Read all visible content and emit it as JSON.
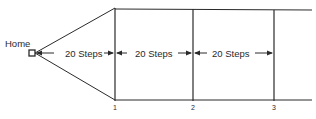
{
  "diagram": {
    "home_label": "Home",
    "segments": [
      {
        "label": "20 Steps"
      },
      {
        "label": "20 Steps"
      },
      {
        "label": "20 Steps"
      }
    ],
    "markers": [
      {
        "label": "1"
      },
      {
        "label": "2"
      },
      {
        "label": "3"
      }
    ],
    "colors": {
      "line": "#2a2a2a",
      "background": "#ffffff"
    }
  }
}
